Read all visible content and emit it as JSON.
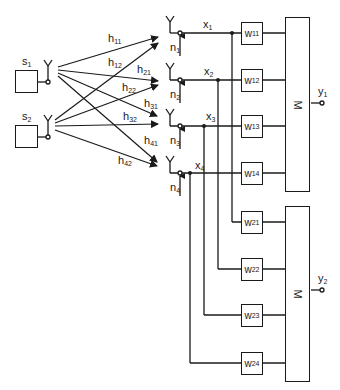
{
  "diagram": {
    "type": "MIMO receiver beamforming block diagram",
    "colors": {
      "stroke": "#1a1a1a",
      "background": "#ffffff"
    },
    "sources": [
      {
        "id": "s1",
        "base": "s",
        "sub": "1"
      },
      {
        "id": "s2",
        "base": "s",
        "sub": "2"
      }
    ],
    "channels": [
      {
        "base": "h",
        "sub": "11"
      },
      {
        "base": "h",
        "sub": "12"
      },
      {
        "base": "h",
        "sub": "21"
      },
      {
        "base": "h",
        "sub": "22"
      },
      {
        "base": "h",
        "sub": "31"
      },
      {
        "base": "h",
        "sub": "32"
      },
      {
        "base": "h",
        "sub": "41"
      },
      {
        "base": "h",
        "sub": "42"
      }
    ],
    "receivers": [
      {
        "signal": {
          "base": "x",
          "sub": "1"
        },
        "noise": {
          "base": "n",
          "sub": "1"
        }
      },
      {
        "signal": {
          "base": "x",
          "sub": "2"
        },
        "noise": {
          "base": "n",
          "sub": "2"
        }
      },
      {
        "signal": {
          "base": "x",
          "sub": "3"
        },
        "noise": {
          "base": "n",
          "sub": "3"
        }
      },
      {
        "signal": {
          "base": "x",
          "sub": "4"
        },
        "noise": {
          "base": "n",
          "sub": "4"
        }
      }
    ],
    "weights_upper": [
      {
        "base": "w",
        "sub": "11"
      },
      {
        "base": "w",
        "sub": "12"
      },
      {
        "base": "w",
        "sub": "13"
      },
      {
        "base": "w",
        "sub": "14"
      }
    ],
    "weights_lower": [
      {
        "base": "w",
        "sub": "21"
      },
      {
        "base": "w",
        "sub": "22"
      },
      {
        "base": "w",
        "sub": "23"
      },
      {
        "base": "w",
        "sub": "24"
      }
    ],
    "combiners": [
      {
        "label": "M"
      },
      {
        "label": "M"
      }
    ],
    "outputs": [
      {
        "base": "y",
        "sub": "1"
      },
      {
        "base": "y",
        "sub": "2"
      }
    ]
  }
}
